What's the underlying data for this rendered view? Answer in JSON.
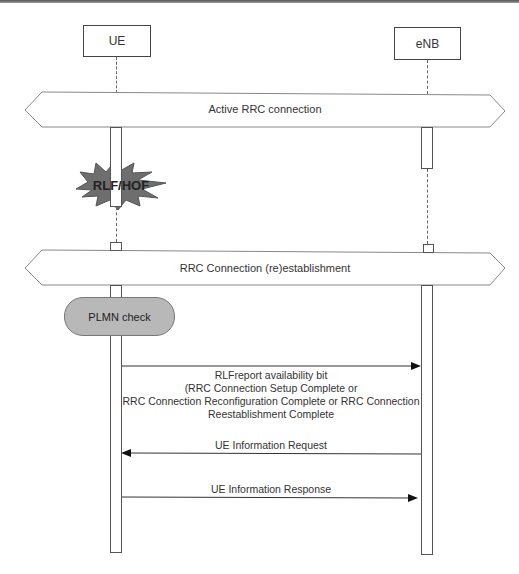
{
  "diagram": {
    "type": "sequence-diagram",
    "participants": [
      {
        "id": "ue",
        "label": "UE"
      },
      {
        "id": "enb",
        "label": "eNB"
      }
    ],
    "bands": [
      {
        "label": "Active RRC connection"
      },
      {
        "label": "RRC Connection (re)establishment"
      }
    ],
    "event": {
      "label": "RLF/HOF",
      "participant": "ue"
    },
    "process": {
      "label": "PLMN check",
      "participant": "ue"
    },
    "messages": [
      {
        "from": "ue",
        "to": "enb",
        "lines": [
          "RLFreport availability bit",
          "(RRC Connection Setup Complete or",
          "RRC Connection Reconfiguration Complete or RRC Connection",
          "Reestablishment Complete"
        ]
      },
      {
        "from": "enb",
        "to": "ue",
        "lines": [
          "UE Information Request"
        ]
      },
      {
        "from": "ue",
        "to": "enb",
        "lines": [
          "UE Information Response"
        ]
      }
    ]
  },
  "colors": {
    "line": "#555555",
    "band_stroke": "#888888",
    "pill_fill": "#b8b8b8",
    "burst_fill": "#6e6e6e"
  }
}
